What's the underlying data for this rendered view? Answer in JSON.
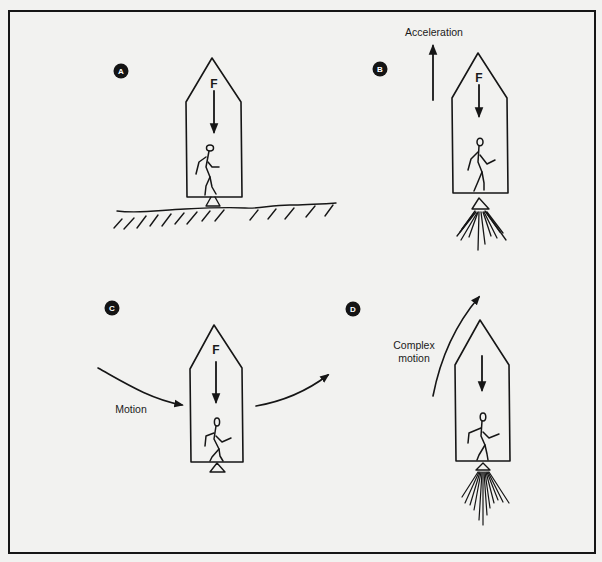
{
  "figure": {
    "background": "#f2f2f0",
    "ink": "#161616",
    "frame": {
      "x": 9,
      "y": 11,
      "width": 586,
      "height": 542
    }
  },
  "panels": [
    {
      "id": "A",
      "marker": "A",
      "force_label": "F",
      "scenario": "Rocket resting on the ground; the weight force F points down and the figure stands on the floor"
    },
    {
      "id": "B",
      "marker": "B",
      "force_label": "F",
      "annotation": "Acceleration",
      "scenario": "Rocket engine firing and accelerating upward; the force F inside still points down"
    },
    {
      "id": "C",
      "marker": "C",
      "force_label": "F",
      "annotation": "Motion",
      "scenario": "Rocket coasting along a curved path; the force F points down"
    },
    {
      "id": "D",
      "marker": "D",
      "force_label": "",
      "annotation_lines": [
        "Complex",
        "motion"
      ],
      "scenario": "Rocket engine firing along a curved upward trajectory; the force arrow points down"
    }
  ]
}
